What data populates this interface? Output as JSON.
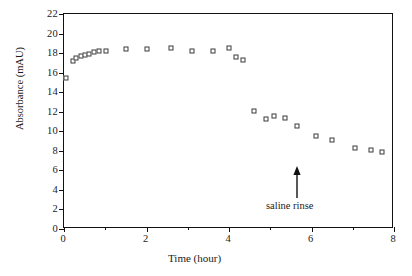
{
  "chart_data": {
    "type": "scatter",
    "title": "",
    "xlabel": "Time (hour)",
    "ylabel": "Absorbance (mAU)",
    "xlim": [
      0,
      8
    ],
    "ylim": [
      0,
      22
    ],
    "xticks": [
      0,
      2,
      4,
      6,
      8
    ],
    "xtick_labels": [
      "0",
      "2",
      "4",
      "6",
      "8"
    ],
    "x_minor_ticks": [
      1,
      3,
      5,
      7
    ],
    "yticks": [
      0,
      2,
      4,
      6,
      8,
      10,
      12,
      14,
      16,
      18,
      20,
      22
    ],
    "ytick_labels": [
      "0",
      "2",
      "4",
      "6",
      "8",
      "10",
      "12",
      "14",
      "16",
      "18",
      "20",
      "22"
    ],
    "grid": false,
    "legend": null,
    "marker": "open-square",
    "marker_color": "#3a3a3a",
    "series": [
      {
        "name": "absorbance",
        "points": [
          [
            0.04,
            15.5
          ],
          [
            0.22,
            17.2
          ],
          [
            0.3,
            17.5
          ],
          [
            0.4,
            17.7
          ],
          [
            0.5,
            17.8
          ],
          [
            0.6,
            17.9
          ],
          [
            0.72,
            18.1
          ],
          [
            0.86,
            18.2
          ],
          [
            1.02,
            18.2
          ],
          [
            1.5,
            18.4
          ],
          [
            2.0,
            18.4
          ],
          [
            2.6,
            18.5
          ],
          [
            3.1,
            18.2
          ],
          [
            3.6,
            18.2
          ],
          [
            4.0,
            18.5
          ],
          [
            4.18,
            17.6
          ],
          [
            4.35,
            17.3
          ],
          [
            4.6,
            12.1
          ],
          [
            4.9,
            11.3
          ],
          [
            5.1,
            11.6
          ],
          [
            5.35,
            11.4
          ],
          [
            5.65,
            10.5
          ],
          [
            6.1,
            9.5
          ],
          [
            6.5,
            9.1
          ],
          [
            7.05,
            8.3
          ],
          [
            7.45,
            8.1
          ],
          [
            7.7,
            7.9
          ]
        ]
      }
    ],
    "annotations": [
      {
        "text": "saline rinse",
        "x": 4.0,
        "y": 6.0,
        "arrow": "up",
        "arrow_tip_y": 9.2
      }
    ]
  }
}
